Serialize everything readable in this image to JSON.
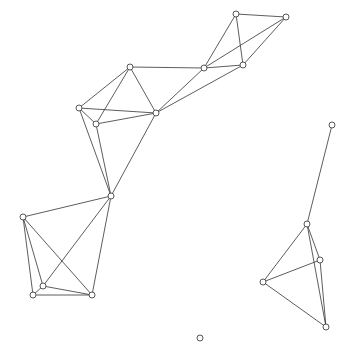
{
  "diagram": {
    "type": "network-graph",
    "colors": {
      "edge": "#333333",
      "node_stroke": "#444444",
      "node_fill": "#ffffff",
      "background": "#ffffff"
    },
    "node_radius": 3,
    "nodes": [
      {
        "id": "A",
        "x": 236,
        "y": 14
      },
      {
        "id": "B",
        "x": 286,
        "y": 17
      },
      {
        "id": "C",
        "x": 204,
        "y": 68
      },
      {
        "id": "D",
        "x": 243,
        "y": 65
      },
      {
        "id": "E",
        "x": 130,
        "y": 67
      },
      {
        "id": "F",
        "x": 79,
        "y": 108
      },
      {
        "id": "G",
        "x": 96,
        "y": 124
      },
      {
        "id": "H",
        "x": 156,
        "y": 113
      },
      {
        "id": "I",
        "x": 111,
        "y": 196
      },
      {
        "id": "J",
        "x": 23,
        "y": 217
      },
      {
        "id": "K",
        "x": 43,
        "y": 286
      },
      {
        "id": "L",
        "x": 33,
        "y": 295
      },
      {
        "id": "M",
        "x": 92,
        "y": 295
      },
      {
        "id": "N",
        "x": 332,
        "y": 125
      },
      {
        "id": "O",
        "x": 307,
        "y": 224
      },
      {
        "id": "P",
        "x": 320,
        "y": 260
      },
      {
        "id": "Q",
        "x": 263,
        "y": 282
      },
      {
        "id": "R",
        "x": 326,
        "y": 327
      },
      {
        "id": "S",
        "x": 200,
        "y": 338
      }
    ],
    "edges": [
      [
        "A",
        "B"
      ],
      [
        "A",
        "C"
      ],
      [
        "A",
        "D"
      ],
      [
        "B",
        "C"
      ],
      [
        "B",
        "D"
      ],
      [
        "C",
        "D"
      ],
      [
        "E",
        "C"
      ],
      [
        "C",
        "H"
      ],
      [
        "D",
        "H"
      ],
      [
        "E",
        "H"
      ],
      [
        "E",
        "F"
      ],
      [
        "E",
        "G"
      ],
      [
        "F",
        "H"
      ],
      [
        "G",
        "H"
      ],
      [
        "F",
        "G"
      ],
      [
        "F",
        "I"
      ],
      [
        "G",
        "I"
      ],
      [
        "H",
        "I"
      ],
      [
        "I",
        "J"
      ],
      [
        "I",
        "K"
      ],
      [
        "I",
        "M"
      ],
      [
        "J",
        "K"
      ],
      [
        "J",
        "L"
      ],
      [
        "J",
        "M"
      ],
      [
        "K",
        "L"
      ],
      [
        "K",
        "M"
      ],
      [
        "L",
        "M"
      ],
      [
        "N",
        "O"
      ],
      [
        "O",
        "P"
      ],
      [
        "O",
        "Q"
      ],
      [
        "O",
        "R"
      ],
      [
        "P",
        "Q"
      ],
      [
        "P",
        "R"
      ],
      [
        "Q",
        "R"
      ]
    ]
  }
}
